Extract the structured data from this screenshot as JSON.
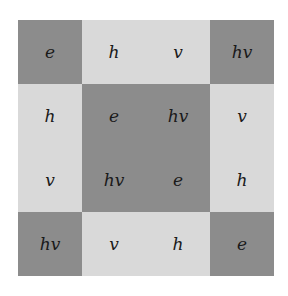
{
  "table": {
    "rows": [
      [
        "e",
        "h",
        "v",
        "hv"
      ],
      [
        "h",
        "e",
        "hv",
        "v"
      ],
      [
        "v",
        "hv",
        "e",
        "h"
      ],
      [
        "hv",
        "v",
        "h",
        "e"
      ]
    ],
    "shading": [
      [
        "dark",
        "light",
        "light",
        "dark"
      ],
      [
        "light",
        "dark",
        "dark",
        "light"
      ],
      [
        "light",
        "dark",
        "dark",
        "light"
      ],
      [
        "dark",
        "light",
        "light",
        "dark"
      ]
    ]
  },
  "colors": {
    "dark": "#8c8c8c",
    "light": "#d9d9d9"
  }
}
